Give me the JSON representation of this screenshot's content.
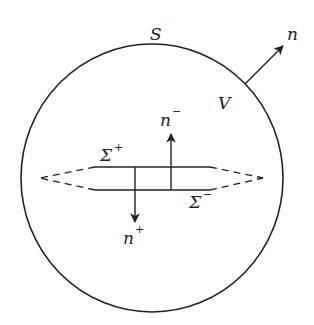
{
  "diagram": {
    "stroke_color": "#222222",
    "background": "#ffffff",
    "labels": {
      "surface": "S",
      "volume": "V",
      "outer_normal": "n",
      "sigma_plus_base": "Σ",
      "sigma_plus_sup": "+",
      "sigma_minus_base": "Σ",
      "sigma_minus_sup": "−",
      "n_minus_base": "n",
      "n_minus_sup": "−",
      "n_plus_base": "n",
      "n_plus_sup": "+"
    },
    "elements": {
      "boundary_circle": {
        "cx": 152,
        "cy": 178,
        "rx": 131,
        "ry": 134
      },
      "outer_normal_arrow": {
        "x1": 245,
        "y1": 84,
        "x2": 283,
        "y2": 46
      },
      "sigma_plus_line": {
        "x1": 95,
        "y1": 167,
        "x2": 210,
        "y2": 167
      },
      "sigma_minus_line": {
        "x1": 95,
        "y1": 190,
        "x2": 210,
        "y2": 190
      },
      "left_dashed_tip": {
        "x": 40,
        "y": 178
      },
      "right_dashed_tip": {
        "x": 263,
        "y": 178
      },
      "n_minus_arrow": {
        "x": 171,
        "y_from": 190,
        "y_to": 134
      },
      "n_plus_arrow": {
        "x": 135,
        "y_from": 167,
        "y_to": 222
      }
    }
  }
}
